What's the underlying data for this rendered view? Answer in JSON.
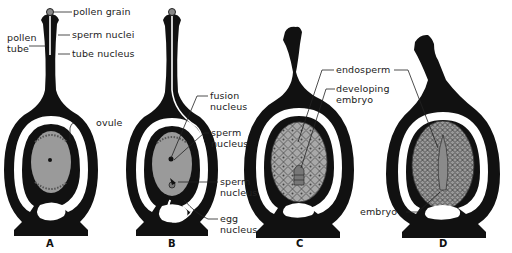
{
  "diagram": {
    "colors": {
      "tissue": "#111111",
      "cavity": "#ffffff",
      "ovule_fill": "#9a9a9a",
      "endosperm_fill": "#a8a8a8"
    },
    "panels": [
      {
        "letter": "A",
        "labels": {
          "pollen_grain": "pollen grain",
          "pollen_tube_1": "pollen",
          "pollen_tube_2": "tube",
          "sperm_nuclei": "sperm nuclei",
          "tube_nucleus": "tube nucleus",
          "ovule": "ovule"
        }
      },
      {
        "letter": "B",
        "labels": {
          "fusion_nucleus_1": "fusion",
          "fusion_nucleus_2": "nucleus",
          "sperm_nucleus_a_1": "sperm",
          "sperm_nucleus_a_2": "nucleus",
          "sperm_nucleus_b_1": "sperm",
          "sperm_nucleus_b_2": "nucleus",
          "egg_nucleus_1": "egg",
          "egg_nucleus_2": "nucleus"
        }
      },
      {
        "letter": "C",
        "labels": {
          "endosperm": "endosperm",
          "developing_embryo_1": "developing",
          "developing_embryo_2": "embryo"
        }
      },
      {
        "letter": "D",
        "labels": {
          "embryo": "embryo"
        }
      }
    ]
  }
}
